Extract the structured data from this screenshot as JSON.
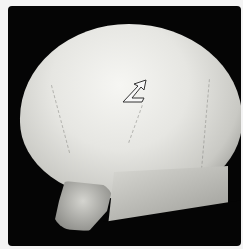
{
  "image": {
    "subject": "3D CT volume rendering of skull, lateral-oblique view",
    "background_color": "#050505",
    "border_color": "#f4f4f4",
    "annotation": {
      "type": "arrow-icon",
      "style": "outlined white arrow pointing up-right",
      "position": {
        "x": 130,
        "y": 85
      }
    }
  }
}
